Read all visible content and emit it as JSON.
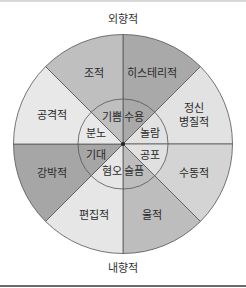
{
  "axis": {
    "top": "외향적",
    "bottom": "내향적"
  },
  "outer_sectors": [
    {
      "label": "히스테리적",
      "color": "#a9a9a9"
    },
    {
      "label": "정신병질적",
      "color": "#e2e2e2",
      "label2": "병질적",
      "label1": "정신"
    },
    {
      "label": "수동적",
      "color": "#d4d4d4"
    },
    {
      "label": "울적",
      "color": "#bdbdbd"
    },
    {
      "label": "편집적",
      "color": "#e6e6e6"
    },
    {
      "label": "강박적",
      "color": "#a6a6a6"
    },
    {
      "label": "공격적",
      "color": "#e8e8e8"
    },
    {
      "label": "조적",
      "color": "#bfbfbf"
    }
  ],
  "inner_sectors": [
    {
      "label": "수용",
      "color": "#a9a9a9"
    },
    {
      "label": "놀람",
      "color": "#e2e2e2"
    },
    {
      "label": "공포",
      "color": "#e0e0e0"
    },
    {
      "label": "슬픔",
      "color": "#bdbdbd"
    },
    {
      "label": "혐오",
      "color": "#e6e6e6"
    },
    {
      "label": "기대",
      "color": "#a6a6a6"
    },
    {
      "label": "분노",
      "color": "#e8e8e8"
    },
    {
      "label": "기쁨",
      "color": "#bfbfbf"
    }
  ]
}
